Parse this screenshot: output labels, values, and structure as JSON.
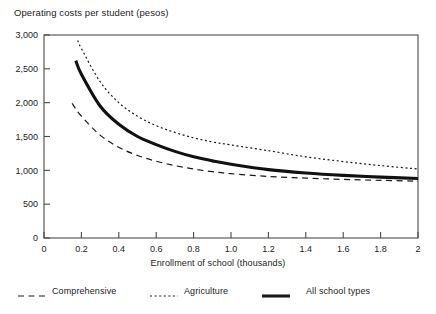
{
  "chart_data": {
    "type": "line",
    "title": "Operating costs per student (pesos)",
    "xlabel": "Enrollment of school (thousands)",
    "ylabel": "",
    "xlim": [
      0,
      2
    ],
    "ylim": [
      0,
      3000
    ],
    "grid": false,
    "legend_position": "below",
    "xticks": [
      "0",
      "0.2",
      "0.4",
      "0.6",
      "0.8",
      "1.0",
      "1.2",
      "1.4",
      "1.6",
      "1.8",
      "2"
    ],
    "xtick_values": [
      0,
      0.2,
      0.4,
      0.6,
      0.8,
      1.0,
      1.2,
      1.4,
      1.6,
      1.8,
      2.0
    ],
    "yticks": [
      "0",
      "500",
      "1,000",
      "1,500",
      "2,000",
      "2,500",
      "3,000"
    ],
    "ytick_values": [
      0,
      500,
      1000,
      1500,
      2000,
      2500,
      3000
    ],
    "series": [
      {
        "name": "Comprehensive",
        "style": "dashed",
        "color": "#1a1a1a",
        "x": [
          0.15,
          0.2,
          0.3,
          0.4,
          0.5,
          0.6,
          0.7,
          0.8,
          0.9,
          1.0,
          1.2,
          1.4,
          1.6,
          1.8,
          2.0
        ],
        "values": [
          1990,
          1800,
          1520,
          1340,
          1220,
          1135,
          1070,
          1020,
          980,
          950,
          910,
          885,
          866,
          852,
          840
        ]
      },
      {
        "name": "Agriculture",
        "style": "dotted",
        "color": "#1a1a1a",
        "x": [
          0.18,
          0.2,
          0.3,
          0.4,
          0.5,
          0.6,
          0.7,
          0.8,
          0.9,
          1.0,
          1.2,
          1.4,
          1.6,
          1.8,
          2.0
        ],
        "values": [
          2920,
          2800,
          2310,
          2000,
          1800,
          1660,
          1560,
          1480,
          1420,
          1375,
          1290,
          1200,
          1130,
          1070,
          1020
        ]
      },
      {
        "name": "All school types",
        "style": "solid-bold",
        "color": "#111111",
        "x": [
          0.17,
          0.2,
          0.3,
          0.4,
          0.5,
          0.6,
          0.7,
          0.8,
          0.9,
          1.0,
          1.2,
          1.4,
          1.6,
          1.8,
          2.0
        ],
        "values": [
          2620,
          2420,
          1950,
          1680,
          1500,
          1380,
          1280,
          1200,
          1140,
          1090,
          1010,
          960,
          925,
          900,
          880
        ]
      }
    ]
  },
  "legend": {
    "items": [
      {
        "label": "Comprehensive",
        "style": "dashed"
      },
      {
        "label": "Agriculture",
        "style": "dotted"
      },
      {
        "label": "All school types",
        "style": "solid-bold"
      }
    ]
  }
}
